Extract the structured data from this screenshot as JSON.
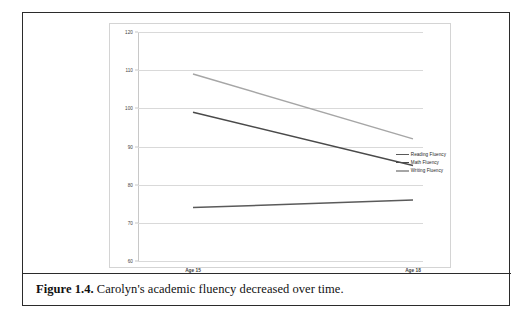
{
  "figure": {
    "caption_label": "Figure 1.4.",
    "caption_text": "Carolyn's academic fluency decreased over time."
  },
  "chart_data": {
    "type": "line",
    "title": "",
    "xlabel": "",
    "ylabel": "",
    "categories": [
      "Age 15",
      "Age 18"
    ],
    "x": [
      0,
      1
    ],
    "ylim": [
      60,
      120
    ],
    "yticks": [
      60,
      70,
      80,
      90,
      100,
      110,
      120
    ],
    "ytick_labels": [
      "60",
      "70",
      "80",
      "90",
      "100",
      "110",
      "120"
    ],
    "grid": true,
    "legend_position": "right",
    "series": [
      {
        "name": "Reading Fluency",
        "values": [
          74,
          76
        ],
        "color": "#5a5a5a"
      },
      {
        "name": "Math Fluency",
        "values": [
          99,
          85
        ],
        "color": "#4a4a4a"
      },
      {
        "name": "Writing Fluency",
        "values": [
          109,
          92
        ],
        "color": "#a6a6a6"
      }
    ]
  }
}
